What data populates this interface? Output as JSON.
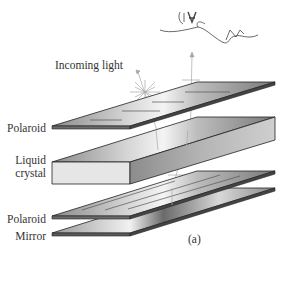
{
  "figure": {
    "panel_label": "(a)",
    "labels": {
      "incoming_light": "Incoming light",
      "polaroid_top": "Polaroid",
      "liquid_crystal": "Liquid\ncrystal",
      "liquid_crystal_line1": "Liquid",
      "liquid_crystal_line2": "crystal",
      "polaroid_bottom": "Polaroid",
      "mirror": "Mirror"
    },
    "layers": [
      {
        "name": "Polaroid",
        "type": "thin-plate",
        "polarization": "horizontal lines"
      },
      {
        "name": "Liquid crystal",
        "type": "thick-slab"
      },
      {
        "name": "Polaroid",
        "type": "thin-plate",
        "polarization": "diagonal lines"
      },
      {
        "name": "Mirror",
        "type": "thin-plate"
      }
    ],
    "observer": "eye-and-nose-sketch",
    "colors": {
      "plate_dark": "#4a4a4a",
      "plate_mid": "#9a9a9a",
      "plate_light": "#e8e8e8",
      "edge": "#222222",
      "light_ray": "#b0b0b0",
      "text": "#333333"
    }
  }
}
